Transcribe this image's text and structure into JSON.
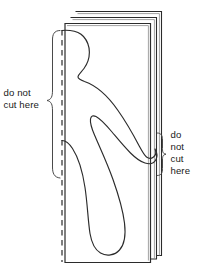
{
  "figure": {
    "background_color": "#ffffff",
    "ink_color": "#2b2b2b",
    "text_color": "#1a1a1a"
  },
  "labels": {
    "left": {
      "name": "do-not-cut-here-left",
      "line1": "do not",
      "line2": "cut here",
      "points_at": "fold-line"
    },
    "right": {
      "name": "do-not-cut-here-right",
      "line1": "do",
      "line2": "not",
      "line3": "cut",
      "line4": "here",
      "points_at": "hand-at-paper-edge"
    }
  },
  "paper_stack": {
    "sheet_count": 3,
    "front_sheet_label": "front-sheet",
    "back_sheet_labels": [
      "second-sheet",
      "third-sheet"
    ]
  },
  "fold_line": {
    "style": "dashed",
    "orientation": "vertical"
  },
  "doll": {
    "description": "half-silhouette of a person on the fold",
    "parts": [
      "head",
      "shoulder",
      "arm",
      "hand",
      "torso",
      "leg",
      "foot"
    ]
  }
}
